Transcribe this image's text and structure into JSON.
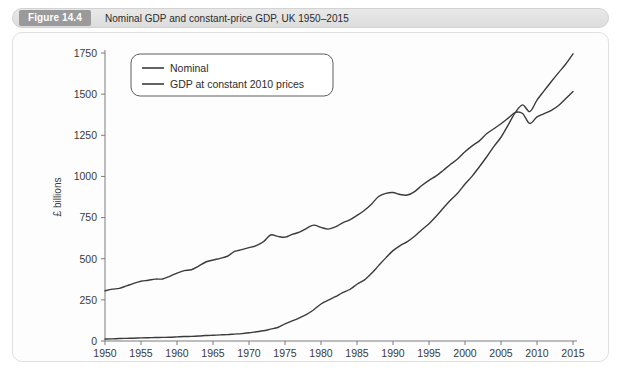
{
  "figure": {
    "badge": "Figure 14.4",
    "title": "Nominal GDP and constant-price GDP, UK 1950–2015",
    "caption": ""
  },
  "colors": {
    "header_bg": "#e3e3e3",
    "badge_bg": "#9a9a9a",
    "panel_bg": "#fdfdfd",
    "line": "#3b3b3b",
    "axis": "#7d7d7d",
    "text": "#2b2b2b"
  },
  "chart_data": {
    "type": "line",
    "title": "Nominal GDP and constant-price GDP, UK 1950–2015",
    "xlabel": "",
    "ylabel": "£ billions",
    "xlim": [
      1950,
      2015
    ],
    "ylim": [
      0,
      1750
    ],
    "xticks": [
      1950,
      1955,
      1960,
      1965,
      1970,
      1975,
      1980,
      1985,
      1990,
      1995,
      2000,
      2005,
      2010,
      2015
    ],
    "yticks": [
      0,
      250,
      500,
      750,
      1000,
      1250,
      1500,
      1750
    ],
    "grid": false,
    "legend_position": "top-left",
    "x": [
      1950,
      1951,
      1952,
      1953,
      1954,
      1955,
      1956,
      1957,
      1958,
      1959,
      1960,
      1961,
      1962,
      1963,
      1964,
      1965,
      1966,
      1967,
      1968,
      1969,
      1970,
      1971,
      1972,
      1973,
      1974,
      1975,
      1976,
      1977,
      1978,
      1979,
      1980,
      1981,
      1982,
      1983,
      1984,
      1985,
      1986,
      1987,
      1988,
      1989,
      1990,
      1991,
      1992,
      1993,
      1994,
      1995,
      1996,
      1997,
      1998,
      1999,
      2000,
      2001,
      2002,
      2003,
      2004,
      2005,
      2006,
      2007,
      2008,
      2009,
      2010,
      2011,
      2012,
      2013,
      2014,
      2015
    ],
    "series": [
      {
        "name": "Nominal",
        "values": [
          12,
          13,
          15,
          16,
          17,
          19,
          20,
          21,
          22,
          23,
          25,
          27,
          28,
          30,
          33,
          35,
          37,
          39,
          42,
          45,
          50,
          56,
          62,
          72,
          82,
          104,
          122,
          141,
          162,
          190,
          225,
          248,
          269,
          294,
          313,
          345,
          370,
          410,
          458,
          505,
          549,
          580,
          604,
          636,
          676,
          713,
          758,
          808,
          857,
          899,
          954,
          1002,
          1059,
          1118,
          1181,
          1238,
          1313,
          1389,
          1435,
          1394,
          1464,
          1521,
          1577,
          1631,
          1683,
          1745
        ]
      },
      {
        "name": "GDP at constant 2010 prices",
        "values": [
          305,
          315,
          320,
          335,
          350,
          363,
          369,
          376,
          377,
          393,
          413,
          428,
          433,
          455,
          480,
          492,
          502,
          515,
          544,
          555,
          567,
          580,
          603,
          644,
          636,
          631,
          648,
          661,
          685,
          704,
          690,
          680,
          693,
          718,
          736,
          763,
          793,
          831,
          878,
          897,
          902,
          890,
          887,
          908,
          945,
          976,
          1003,
          1038,
          1074,
          1107,
          1150,
          1186,
          1216,
          1259,
          1290,
          1320,
          1354,
          1389,
          1382,
          1322,
          1362,
          1382,
          1402,
          1431,
          1473,
          1516
        ]
      }
    ]
  },
  "legend": {
    "items": [
      {
        "label": "Nominal"
      },
      {
        "label": "GDP at constant 2010 prices"
      }
    ]
  }
}
